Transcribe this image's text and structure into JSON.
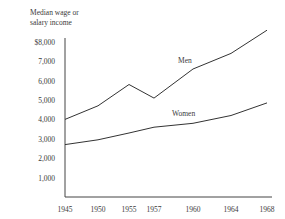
{
  "chart_data": {
    "type": "line",
    "title": "",
    "xlabel": "",
    "ylabel": "Median wage or salary income",
    "x": [
      "1945",
      "1950",
      "1955",
      "1957",
      "1960",
      "1964",
      "1968"
    ],
    "series": [
      {
        "name": "Men",
        "values": [
          4000,
          4700,
          5800,
          5100,
          6600,
          7400,
          8600
        ]
      },
      {
        "name": "Women",
        "values": [
          2700,
          2950,
          3300,
          3600,
          3800,
          4200,
          4850
        ]
      }
    ],
    "yticks": [
      "$8,000",
      "7,000",
      "6,000",
      "5,000",
      "4,000",
      "3,000",
      "2,000",
      "1,000"
    ],
    "ylim": [
      0,
      9000
    ],
    "grid": false,
    "legend": "inline labels"
  },
  "labels": {
    "ylabel_line1": "Median wage or",
    "ylabel_line2": "salary income",
    "men": "Men",
    "women": "Women"
  }
}
